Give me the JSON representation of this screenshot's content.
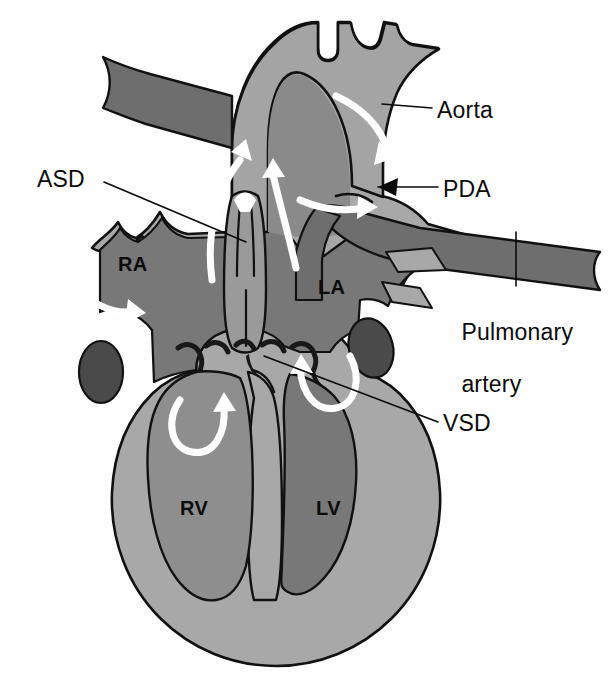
{
  "figure": {
    "type": "anatomical-diagram",
    "style": "grayscale line illustration with white blood-flow arrows"
  },
  "labels": {
    "aorta": "Aorta",
    "pda": "PDA",
    "pulmonary_artery_line1": "Pulmonary",
    "pulmonary_artery_line2": "artery",
    "vsd": "VSD",
    "asd": "ASD"
  },
  "chambers": {
    "ra": "RA",
    "la": "LA",
    "rv": "RV",
    "lv": "LV"
  },
  "colors": {
    "background": "#fefefe",
    "myocardium": "#a8a8a8",
    "aorta_fill": "#a4a4a4",
    "rv_chamber": "#8e8e8e",
    "chamber_dark": "#787878",
    "vessel_dark": "#6e6e6e",
    "coronary_oval": "#4a4a4a",
    "outline": "#111111",
    "arrow_white": "#ffffff",
    "label_text": "#0b0b0b"
  }
}
